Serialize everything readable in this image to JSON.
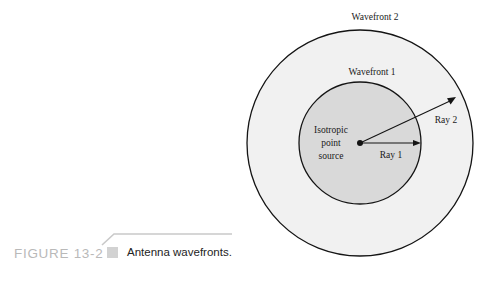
{
  "figure": {
    "caption_number": "FIGURE 13-2",
    "caption_text": "Antenna wavefronts.",
    "marker_icon": "square-marker-icon"
  },
  "diagram": {
    "type": "concentric-wavefront-diagram",
    "labels": {
      "wavefront_outer": "Wavefront 2",
      "wavefront_inner": "Wavefront 1",
      "source_line_1": "Isotropic",
      "source_line_2": "point",
      "source_line_3": "source",
      "ray_inner": "Ray 1",
      "ray_outer": "Ray 2"
    },
    "geometry": {
      "center_x": 360,
      "center_y": 143,
      "outer_radius": 113,
      "inner_radius": 61,
      "source_dot_radius": 3,
      "ray1_tip_x": 420,
      "ray1_tip_y": 143,
      "ray2_tip_x": 455,
      "ray2_tip_y": 97
    },
    "colors": {
      "outer_fill": "#f1f1f1",
      "inner_fill": "#d9d9d9",
      "stroke": "#141414",
      "text": "#1a1a1a",
      "caption_number": "#b9b9b9",
      "caption_marker": "#d2d2d2",
      "caption_rule": "#c9c9c9"
    }
  }
}
